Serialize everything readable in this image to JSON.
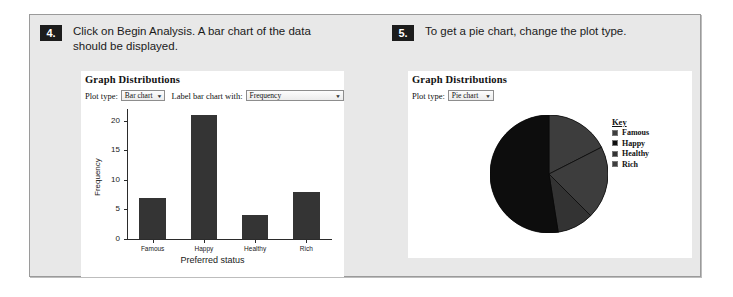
{
  "steps": [
    {
      "number": "4.",
      "text": "Click on Begin Analysis. A bar chart of the data should be displayed."
    },
    {
      "number": "5.",
      "text": "To get a pie chart, change the plot type."
    }
  ],
  "bar_panel": {
    "title": "Graph Distributions",
    "plot_type_label": "Plot type:",
    "plot_type_value": "Bar chart",
    "label_with_label": "Label bar chart with:",
    "label_with_value": "Frequency",
    "dropdown_arrow": "▼"
  },
  "pie_panel": {
    "title": "Graph Distributions",
    "plot_type_label": "Plot type:",
    "plot_type_value": "Pie chart",
    "dropdown_arrow": "▼",
    "legend_title": "Key"
  },
  "colors": {
    "bar_fill": "#343434",
    "badge_bg": "#1c1c1c",
    "panel_bg": "#ffffff",
    "page_bg": "#e8e8e8",
    "slice_famous": "#3d3d3d",
    "slice_happy": "#0d0d0d",
    "slice_healthy": "#333333",
    "slice_rich": "#3d3d3d"
  },
  "chart_data": [
    {
      "type": "bar",
      "title": "Graph Distributions",
      "categories": [
        "Famous",
        "Happy",
        "Healthy",
        "Rich"
      ],
      "values": [
        7,
        21,
        4,
        8
      ],
      "xlabel": "Preferred status",
      "ylabel": "Frequency",
      "ylim": [
        0,
        22
      ],
      "yticks": [
        0,
        5,
        10,
        15,
        20
      ],
      "ytick_labels": [
        "0",
        "5",
        "10",
        "15",
        "20"
      ],
      "grid": false,
      "legend": false
    },
    {
      "type": "pie",
      "title": "Graph Distributions",
      "categories": [
        "Famous",
        "Happy",
        "Healthy",
        "Rich"
      ],
      "values": [
        7,
        21,
        4,
        8
      ],
      "legend_title": "Key",
      "legend_position": "right",
      "start_angle_deg": 0,
      "direction": "clockwise"
    }
  ]
}
